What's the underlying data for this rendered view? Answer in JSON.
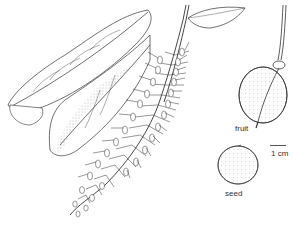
{
  "figure": {
    "type": "botanical-illustration",
    "subjects": [
      "leafy branch with raceme inflorescence",
      "fruit",
      "seed"
    ],
    "labels": {
      "fruit": "fruit",
      "seed": "seed",
      "scale": "1 cm"
    },
    "colors": {
      "ink": "#333333",
      "background": "#ffffff"
    }
  }
}
